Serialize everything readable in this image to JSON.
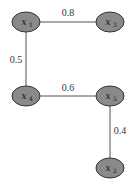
{
  "diagram": {
    "type": "weighted-graph",
    "nodes": [
      {
        "id": "x1",
        "var": "x",
        "sub": "1"
      },
      {
        "id": "x3",
        "var": "x",
        "sub": "3"
      },
      {
        "id": "x4",
        "var": "x",
        "sub": "4"
      },
      {
        "id": "x5",
        "var": "x",
        "sub": "5"
      },
      {
        "id": "x2",
        "var": "x",
        "sub": "2"
      }
    ],
    "edges": [
      {
        "from": "x1",
        "to": "x3",
        "weight": "0.8"
      },
      {
        "from": "x1",
        "to": "x4",
        "weight": "0.5"
      },
      {
        "from": "x4",
        "to": "x5",
        "weight": "0.6"
      },
      {
        "from": "x5",
        "to": "x2",
        "weight": "0.4"
      }
    ],
    "colors": {
      "node_fill": "#8a8a8a",
      "node_stroke": "#333333",
      "edge": "#555555"
    }
  }
}
